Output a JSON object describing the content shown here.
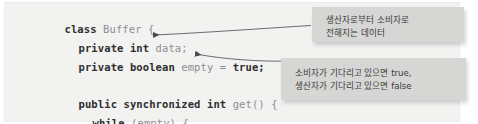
{
  "figure": {
    "kind": "annotated-code-figure",
    "background_color": "#ffffff",
    "code_panel_color": "#f2f2f1",
    "callout_color": "#d6d6d4",
    "keyword_color": "#2f2f2f",
    "plain_color": "#8e8e8e"
  },
  "code": {
    "language": "java",
    "lines": [
      {
        "id": "line-class",
        "segments": [
          {
            "text": "class ",
            "style": "keyword"
          },
          {
            "text": "Buffer {",
            "style": "plain"
          }
        ]
      },
      {
        "id": "line-data-field",
        "segments": [
          {
            "text": "private int ",
            "style": "keyword"
          },
          {
            "text": "data;",
            "style": "plain"
          }
        ]
      },
      {
        "id": "line-empty-field",
        "segments": [
          {
            "text": "private boolean ",
            "style": "keyword"
          },
          {
            "text": "empty = ",
            "style": "plain"
          },
          {
            "text": "true;",
            "style": "keyword"
          }
        ]
      },
      {
        "id": "line-get-method",
        "segments": [
          {
            "text": "public synchronized int ",
            "style": "keyword"
          },
          {
            "text": "get() {",
            "style": "plain"
          }
        ]
      },
      {
        "id": "line-while",
        "segments": [
          {
            "text": "while ",
            "style": "keyword"
          },
          {
            "text": "(empty) {",
            "style": "plain"
          }
        ]
      }
    ]
  },
  "callouts": [
    {
      "id": "callout-data-field",
      "line1": "생산자로부터 소비자로",
      "line2": "전해지는 데이터",
      "points_to": "line-data-field"
    },
    {
      "id": "callout-empty-field",
      "line1": "소비자가 기다리고 있으면 true,",
      "line2": "생산자가 기다리고 있으면 false",
      "points_to": "line-empty-field"
    }
  ]
}
